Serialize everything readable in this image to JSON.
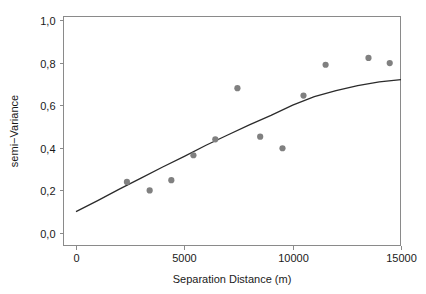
{
  "chart_data": {
    "type": "scatter",
    "title": "",
    "subtitle": "",
    "xlabel": "Separation Distance (m)",
    "ylabel": "semi−Variance",
    "xlim": [
      0,
      15000
    ],
    "ylim": [
      0.0,
      1.0
    ],
    "grid": false,
    "legend": "none",
    "decimal_separator": ",",
    "x_ticks": [
      0,
      5000,
      10000,
      15000
    ],
    "x_tick_labels": [
      "0",
      "5000",
      "10000",
      "15000"
    ],
    "y_ticks": [
      0.0,
      0.2,
      0.4,
      0.6,
      0.8,
      1.0
    ],
    "y_tick_labels": [
      "0,0",
      "0,2",
      "0,4",
      "0,6",
      "0,8",
      "1,0"
    ],
    "series": [
      {
        "name": "empirical semivariogram",
        "type": "scatter",
        "marker": "filled-circle",
        "color": "#808080",
        "points": [
          {
            "x": 2350,
            "y": 0.24
          },
          {
            "x": 3400,
            "y": 0.2
          },
          {
            "x": 4400,
            "y": 0.248
          },
          {
            "x": 5420,
            "y": 0.365
          },
          {
            "x": 6430,
            "y": 0.44
          },
          {
            "x": 7450,
            "y": 0.68
          },
          {
            "x": 8500,
            "y": 0.452
          },
          {
            "x": 9530,
            "y": 0.398
          },
          {
            "x": 10500,
            "y": 0.645
          },
          {
            "x": 11520,
            "y": 0.79
          },
          {
            "x": 13500,
            "y": 0.822
          },
          {
            "x": 14480,
            "y": 0.798
          }
        ]
      },
      {
        "name": "fitted model",
        "type": "line",
        "color": "#2b2b2b",
        "points": [
          {
            "x": 0,
            "y": 0.1
          },
          {
            "x": 1000,
            "y": 0.152
          },
          {
            "x": 2000,
            "y": 0.206
          },
          {
            "x": 3000,
            "y": 0.258
          },
          {
            "x": 4000,
            "y": 0.31
          },
          {
            "x": 5000,
            "y": 0.36
          },
          {
            "x": 6000,
            "y": 0.412
          },
          {
            "x": 7000,
            "y": 0.46
          },
          {
            "x": 8000,
            "y": 0.508
          },
          {
            "x": 9000,
            "y": 0.552
          },
          {
            "x": 10000,
            "y": 0.6
          },
          {
            "x": 11000,
            "y": 0.64
          },
          {
            "x": 12000,
            "y": 0.668
          },
          {
            "x": 13000,
            "y": 0.692
          },
          {
            "x": 14000,
            "y": 0.71
          },
          {
            "x": 15000,
            "y": 0.72
          }
        ]
      }
    ]
  }
}
